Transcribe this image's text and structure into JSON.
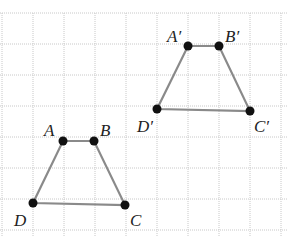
{
  "diagram": {
    "type": "geometry-translation",
    "grid": {
      "x_lines": [
        2,
        33,
        64,
        95,
        126,
        157,
        188,
        219,
        250,
        281
      ],
      "y_lines": [
        13,
        44,
        75,
        106,
        137,
        168,
        199,
        230
      ],
      "y_top": 13,
      "y_bottom": 237,
      "x_left": 0,
      "x_right": 287
    },
    "colors": {
      "edge": "#8a8a8a",
      "point": "#111111",
      "grid": "#c8c8c8",
      "label": "#222222"
    },
    "shapes": [
      {
        "name": "ABCD",
        "vertices": [
          {
            "label": "A",
            "x": 63,
            "y": 141,
            "lx": 44,
            "ly": 136
          },
          {
            "label": "B",
            "x": 94,
            "y": 141,
            "lx": 100,
            "ly": 136
          },
          {
            "label": "C",
            "x": 125,
            "y": 205,
            "lx": 130,
            "ly": 226
          },
          {
            "label": "D",
            "x": 33,
            "y": 203,
            "lx": 14,
            "ly": 226
          }
        ]
      },
      {
        "name": "A'B'C'D'",
        "vertices": [
          {
            "label": "A′",
            "x": 188,
            "y": 46,
            "lx": 167,
            "ly": 42
          },
          {
            "label": "B′",
            "x": 219,
            "y": 46,
            "lx": 225,
            "ly": 42
          },
          {
            "label": "C′",
            "x": 250,
            "y": 111,
            "lx": 254,
            "ly": 132
          },
          {
            "label": "D′",
            "x": 157,
            "y": 109,
            "lx": 137,
            "ly": 132
          }
        ]
      }
    ]
  }
}
